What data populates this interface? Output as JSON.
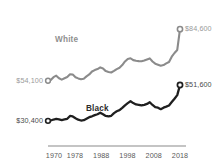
{
  "chart_data": {
    "type": "line",
    "title": "",
    "subtitle": "",
    "xlabel": "",
    "ylabel": "",
    "grid": false,
    "legend_position": "inline-annotation",
    "xlim": [
      1970,
      2018
    ],
    "ylim": [
      25000,
      90000
    ],
    "x_tick_labels": [
      "1970",
      "1978",
      "1988",
      "1998",
      "2008",
      "2018"
    ],
    "x_ticks": [
      1970,
      1978,
      1988,
      1998,
      2008,
      2018
    ],
    "series": [
      {
        "name": "White",
        "color": "#8b8b8b",
        "start_label": "$54,100",
        "end_label": "$84,600",
        "start_value": 54100,
        "end_value": 84600,
        "x": [
          1970,
          1971,
          1972,
          1973,
          1974,
          1975,
          1976,
          1977,
          1978,
          1979,
          1980,
          1981,
          1982,
          1983,
          1984,
          1985,
          1986,
          1987,
          1988,
          1989,
          1990,
          1991,
          1992,
          1993,
          1994,
          1995,
          1996,
          1997,
          1998,
          1999,
          2000,
          2001,
          2002,
          2003,
          2004,
          2005,
          2006,
          2007,
          2008,
          2009,
          2010,
          2011,
          2012,
          2013,
          2014,
          2015,
          2016,
          2017,
          2018
        ],
        "values": [
          54100,
          54500,
          56200,
          57100,
          55600,
          54800,
          55600,
          56300,
          57900,
          57800,
          56200,
          55500,
          55000,
          55300,
          56700,
          57800,
          59600,
          60400,
          61000,
          62000,
          61300,
          59800,
          59300,
          59000,
          59900,
          61000,
          61800,
          63400,
          65500,
          67000,
          67400,
          66300,
          65900,
          65700,
          65600,
          66100,
          66700,
          67300,
          65500,
          64200,
          63600,
          63000,
          63400,
          64400,
          65200,
          68300,
          70500,
          72300,
          84600
        ]
      },
      {
        "name": "Black",
        "color": "#1f1f1f",
        "start_label": "$30,400",
        "end_label": "$51,600",
        "start_value": 30400,
        "end_value": 51600,
        "x": [
          1970,
          1971,
          1972,
          1973,
          1974,
          1975,
          1976,
          1977,
          1978,
          1979,
          1980,
          1981,
          1982,
          1983,
          1984,
          1985,
          1986,
          1987,
          1988,
          1989,
          1990,
          1991,
          1992,
          1993,
          1994,
          1995,
          1996,
          1997,
          1998,
          1999,
          2000,
          2001,
          2002,
          2003,
          2004,
          2005,
          2006,
          2007,
          2008,
          2009,
          2010,
          2011,
          2012,
          2013,
          2014,
          2015,
          2016,
          2017,
          2018
        ],
        "values": [
          30400,
          30600,
          31200,
          31600,
          31300,
          30900,
          31300,
          31600,
          33300,
          33000,
          32000,
          31100,
          30600,
          30800,
          31700,
          32600,
          33100,
          33800,
          34300,
          35200,
          34300,
          33300,
          33000,
          33400,
          35000,
          36100,
          36700,
          38100,
          39600,
          40900,
          42000,
          40900,
          40100,
          39900,
          39500,
          39800,
          40400,
          41400,
          39800,
          38500,
          38200,
          37300,
          38200,
          38800,
          39500,
          41500,
          43500,
          45600,
          51600
        ]
      }
    ]
  },
  "axis": {
    "line_color": "#8a8a8a"
  }
}
